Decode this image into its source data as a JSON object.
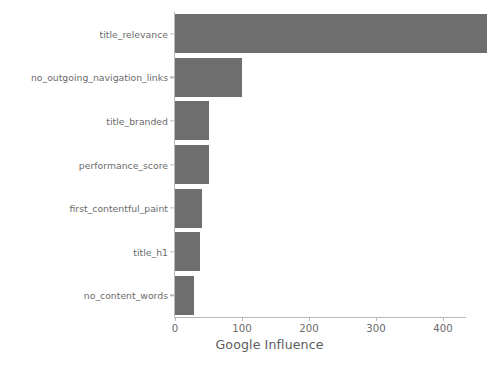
{
  "chart_data": {
    "type": "bar",
    "orientation": "horizontal",
    "title": "",
    "subtitle": "",
    "xlabel": "Google Influence",
    "ylabel": "",
    "categories": [
      "title_relevance",
      "no_outgoing_navigation_links",
      "title_branded",
      "performance_score",
      "first_contentful_paint",
      "title_h1",
      "no_content_words"
    ],
    "values": [
      465,
      100,
      50,
      50,
      41,
      38,
      29
    ],
    "xlim": [
      0,
      435
    ],
    "ylim_categories": 7,
    "xticks": [
      0,
      100,
      200,
      300,
      400
    ],
    "xticklabels": [
      "0",
      "100",
      "200",
      "300",
      "400"
    ],
    "grid": false,
    "legend": null,
    "bar_color": "#6e6e6e",
    "axis_color": "#b8b8b8",
    "tick_label_color": "#6b6b6b",
    "axis_label_color": "#5c5c5c",
    "background_color": "#ffffff"
  }
}
